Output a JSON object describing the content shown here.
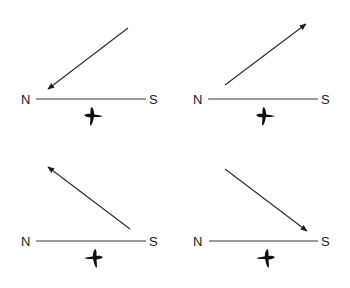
{
  "diagram": {
    "colors": {
      "ink": "#1a1a1a",
      "background": "#ffffff"
    },
    "panels": [
      {
        "id": "top-left",
        "left_label": "N",
        "right_label": "S",
        "arrow_direction": "toward N (down-left)",
        "icon": "bird-icon"
      },
      {
        "id": "top-right",
        "left_label": "N",
        "right_label": "S",
        "arrow_direction": "away from N (up-right)",
        "icon": "bird-icon"
      },
      {
        "id": "bottom-left",
        "left_label": "N",
        "right_label": "S",
        "arrow_direction": "away from S (up-left)",
        "icon": "bird-icon"
      },
      {
        "id": "bottom-right",
        "left_label": "N",
        "right_label": "S",
        "arrow_direction": "toward S (down-right)",
        "icon": "bird-icon"
      }
    ]
  }
}
